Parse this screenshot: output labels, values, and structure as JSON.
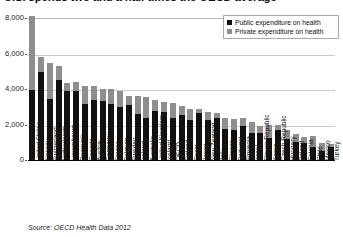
{
  "title": "U.S. spends two and a half times the OECD average",
  "source": "Source: OECD Health Data 2012",
  "legend": {
    "items": [
      {
        "label": "Public expenditure on health",
        "color": "#111111",
        "key": "public"
      },
      {
        "label": "Private expenditure on health",
        "color": "#8e8e8e",
        "key": "private"
      }
    ]
  },
  "chart_data": {
    "type": "bar",
    "subtype": "stacked-column",
    "title": "U.S. spends two and a half times the OECD average",
    "xlabel": "",
    "ylabel": "",
    "ylim": [
      0,
      8000
    ],
    "yticks": [
      "0",
      "2,000",
      "4,000",
      "6,000",
      "8,000"
    ],
    "ytick_values": [
      0,
      2000,
      4000,
      6000,
      8000
    ],
    "grid": true,
    "legend_position": "top-right",
    "categories": [
      "United States",
      "Norway",
      "Switzerland",
      "Netherlands",
      "Luxembourg",
      "Denmark",
      "Canada",
      "Austria",
      "Germany",
      "France",
      "Belgium",
      "Sweden",
      "Ireland",
      "Australia",
      "United Kingdom",
      "Iceland",
      "OECD",
      "Finland",
      "Spain",
      "Japan",
      "New Zealand",
      "Italy",
      "Greece",
      "Portugal",
      "Slovenia",
      "Israel",
      "Slovak Republic",
      "Korea",
      "Czech Republic",
      "Hungary",
      "Poland",
      "Estonia",
      "Chile",
      "Mexico",
      "Turkey"
    ],
    "series": [
      {
        "name": "Public expenditure on health",
        "color": "#111111",
        "values": [
          3967,
          4931,
          3426,
          4496,
          3912,
          3890,
          3183,
          3353,
          3332,
          3134,
          3000,
          3077,
          2592,
          2345,
          2747,
          2679,
          2377,
          2511,
          2269,
          2644,
          2282,
          2364,
          1726,
          1668,
          1907,
          1496,
          1531,
          1230,
          1712,
          1204,
          1024,
          931,
          718,
          486,
          723
        ]
      },
      {
        "name": "Private expenditure on health",
        "color": "#8e8e8e",
        "values": [
          4137,
          850,
          2048,
          820,
          454,
          510,
          962,
          802,
          676,
          845,
          898,
          554,
          1006,
          1188,
          658,
          603,
          858,
          524,
          627,
          223,
          448,
          259,
          632,
          651,
          458,
          673,
          383,
          756,
          234,
          485,
          430,
          369,
          632,
          491,
          183
        ]
      }
    ],
    "totals": [
      8104,
      5781,
      5474,
      5316,
      4366,
      4400,
      4145,
      4155,
      4008,
      3979,
      3898,
      3631,
      3598,
      3533,
      3405,
      3282,
      3235,
      3035,
      2896,
      2867,
      2730,
      2623,
      2358,
      2319,
      2365,
      2169,
      1914,
      1986,
      1946,
      1689,
      1454,
      1300,
      1350,
      977,
      906
    ]
  }
}
